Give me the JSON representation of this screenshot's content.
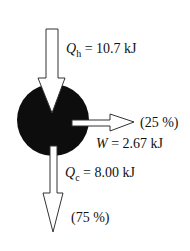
{
  "diagram": {
    "type": "heat-engine-energy-flow",
    "engine_color": "#0d0d0d",
    "arrow_stroke": "#333333",
    "heat_in": {
      "symbol": "Q",
      "subscript": "h",
      "equals": " = ",
      "value": "10.7 kJ"
    },
    "work_out": {
      "symbol": "W",
      "equals": " = ",
      "value": "2.67 kJ",
      "percent": "(25 %)"
    },
    "heat_out": {
      "symbol": "Q",
      "subscript": "c",
      "equals": " = ",
      "value": "8.00 kJ",
      "percent": "(75 %)"
    }
  }
}
